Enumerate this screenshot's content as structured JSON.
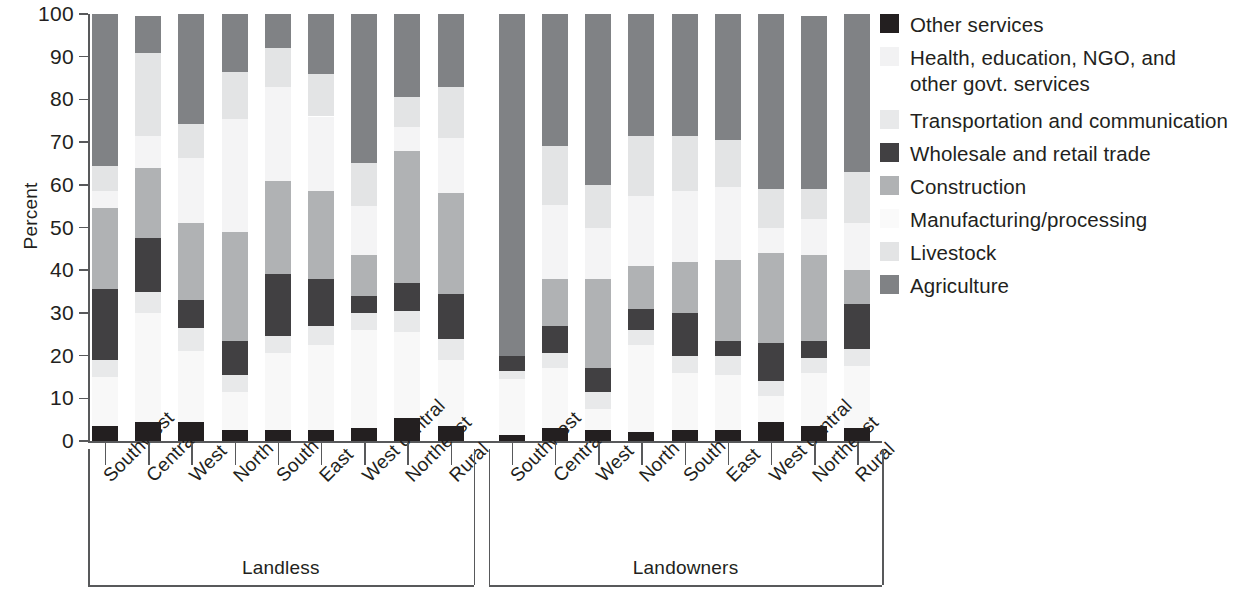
{
  "chart_data": {
    "type": "bar",
    "subtype": "stacked-bar-100",
    "title": "",
    "xlabel": "",
    "ylabel": "Percent",
    "ylim": [
      0,
      100
    ],
    "yticks": [
      0,
      10,
      20,
      30,
      40,
      50,
      60,
      70,
      80,
      90,
      100
    ],
    "grid": false,
    "legend_position": "right",
    "group_labels": [
      "Landless",
      "Landowners"
    ],
    "categories": [
      "Southwest",
      "Central",
      "West",
      "North",
      "South",
      "East",
      "West central",
      "Northeast",
      "Rural",
      "Southwest",
      "Central",
      "West",
      "North",
      "South",
      "East",
      "West central",
      "Northeast",
      "Rural"
    ],
    "series": [
      {
        "name": "Agriculture",
        "color": "#808285",
        "values": [
          35.5,
          8.7,
          25.8,
          13.5,
          8.0,
          14.0,
          35.0,
          19.5,
          17.0,
          80.0,
          30.8,
          40.0,
          28.6,
          28.5,
          29.5,
          41.0,
          40.5,
          37.0
        ]
      },
      {
        "name": "Livestock",
        "color": "#e3e4e5",
        "values": [
          6.0,
          19.3,
          8.0,
          11.0,
          9.0,
          10.0,
          10.0,
          7.0,
          12.0,
          0.0,
          14.0,
          10.0,
          14.0,
          13.0,
          11.0,
          9.0,
          7.0,
          12.0
        ]
      },
      {
        "name": "Manufacturing/processing",
        "color": "#f4f4f5",
        "values": [
          4.0,
          7.5,
          15.2,
          26.5,
          22.0,
          17.5,
          11.5,
          5.5,
          13.0,
          0.0,
          17.2,
          12.0,
          16.4,
          16.5,
          17.0,
          6.0,
          8.5,
          11.0
        ]
      },
      {
        "name": "Construction",
        "color": "#b0b2b4",
        "values": [
          19.0,
          16.5,
          18.0,
          25.5,
          22.0,
          20.5,
          9.5,
          31.0,
          23.5,
          0.0,
          11.0,
          21.0,
          10.0,
          12.0,
          19.0,
          21.0,
          20.0,
          8.0
        ]
      },
      {
        "name": "Wholesale and retail trade",
        "color": "#414042",
        "values": [
          16.5,
          12.5,
          6.5,
          8.0,
          14.5,
          11.0,
          4.0,
          6.5,
          10.5,
          3.5,
          6.5,
          5.5,
          5.0,
          10.0,
          3.5,
          9.0,
          4.0,
          10.5
        ]
      },
      {
        "name": "Transportation and communication",
        "color": "#e8e9ea",
        "values": [
          4.0,
          5.0,
          5.5,
          4.0,
          4.0,
          4.5,
          4.0,
          5.0,
          5.0,
          2.0,
          3.5,
          4.0,
          3.5,
          4.0,
          4.5,
          3.5,
          3.5,
          4.0
        ]
      },
      {
        "name": "Health, education, NGO, and other govt. services",
        "color": "#f8f8f8",
        "values": [
          11.5,
          25.5,
          16.5,
          9.0,
          18.0,
          20.0,
          23.0,
          20.0,
          15.5,
          13.0,
          14.0,
          5.0,
          20.5,
          13.5,
          13.0,
          6.0,
          12.5,
          14.5
        ]
      },
      {
        "name": "Other services",
        "color": "#231f20",
        "values": [
          3.5,
          4.5,
          4.5,
          2.5,
          2.5,
          2.5,
          3.0,
          5.5,
          3.5,
          1.5,
          3.0,
          2.5,
          2.0,
          2.5,
          2.5,
          4.5,
          3.5,
          3.0
        ]
      }
    ]
  },
  "legend": {
    "entries": [
      {
        "label": "Other services",
        "color": "#231f20"
      },
      {
        "label": "Health, education, NGO, and\nother govt. services",
        "color": "#f2f2f3"
      },
      {
        "label": "Transportation and communication",
        "color": "#e8e9ea"
      },
      {
        "label": "Wholesale and retail trade",
        "color": "#414042"
      },
      {
        "label": "Construction",
        "color": "#b0b2b4"
      },
      {
        "label": "Manufacturing/processing",
        "color": "#fafafa"
      },
      {
        "label": "Livestock",
        "color": "#e3e4e5"
      },
      {
        "label": "Agriculture",
        "color": "#808285"
      }
    ]
  },
  "axis": {
    "y_label": "Percent",
    "y_ticks": [
      "100",
      "90",
      "80",
      "70",
      "60",
      "50",
      "40",
      "30",
      "20",
      "10",
      "0"
    ]
  }
}
